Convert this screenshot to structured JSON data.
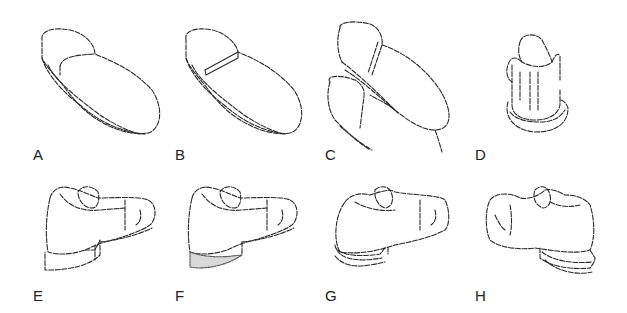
{
  "figure": {
    "type": "patent-style line drawings of shoe soles and shoes",
    "panels": [
      {
        "id": "A",
        "label": "A",
        "description": "sole with separate heel section (curved joint)"
      },
      {
        "id": "B",
        "label": "B",
        "description": "sole with straight breast heel"
      },
      {
        "id": "C",
        "label": "C",
        "description": "two soles overlapping, flexed"
      },
      {
        "id": "D",
        "label": "D",
        "description": "shoe viewed from heel end"
      },
      {
        "id": "E",
        "label": "E",
        "description": "shoe with raised block heel"
      },
      {
        "id": "F",
        "label": "F",
        "description": "shoe with shaded heel region"
      },
      {
        "id": "G",
        "label": "G",
        "description": "shoe with layered sole, side view facing right"
      },
      {
        "id": "H",
        "label": "H",
        "description": "shoe with layered sole, side view facing left"
      }
    ]
  }
}
